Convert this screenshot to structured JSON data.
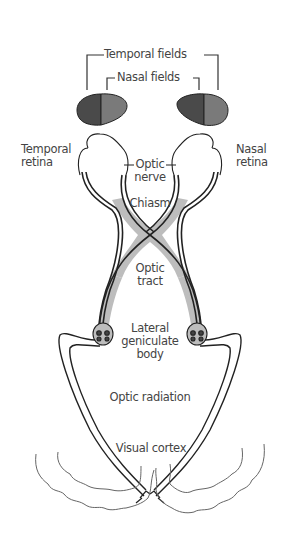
{
  "diagram": {
    "type": "anatomy",
    "labels": {
      "temporal_fields": "Temporal fields",
      "nasal_fields": "Nasal fields",
      "temporal_retina_1": "Temporal",
      "temporal_retina_2": "retina",
      "nasal_retina_1": "Nasal",
      "nasal_retina_2": "retina",
      "optic_nerve_1": "Optic",
      "optic_nerve_2": "nerve",
      "chiasm": "Chiasm",
      "optic_tract_1": "Optic",
      "optic_tract_2": "tract",
      "lgb_1": "Lateral",
      "lgb_2": "geniculate",
      "lgb_3": "body",
      "optic_radiation": "Optic radiation",
      "visual_cortex": "Visual cortex"
    },
    "colors": {
      "line": "#222222",
      "tract_fill": "#bdbdbd",
      "temporal_field": "#4a4a4a",
      "nasal_field": "#7a7a7a",
      "cortex": "#666666",
      "text": "#444444"
    }
  }
}
